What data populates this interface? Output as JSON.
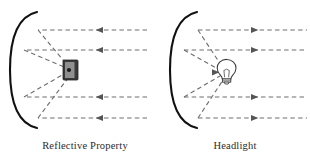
{
  "figure": {
    "background_color": "#ffffff",
    "width": 310,
    "height": 161
  },
  "style": {
    "parabola_color": "#111111",
    "parabola_width": 2.1,
    "ray_color": "#6f6f6f",
    "ray_width": 1.15,
    "ray_dash": "4.5 3.2",
    "arrow_color": "#555555",
    "receiver_body_color": "#3a3a3a",
    "receiver_face_color": "#8a8a8a",
    "receiver_dot_color": "#1a1a1a",
    "bulb_outline_color": "#3a3a3a",
    "bulb_fill_color": "#ffffff",
    "caption_color": "#2b2b2b"
  },
  "panels": [
    {
      "id": "reflective-property",
      "caption": "Reflective Property",
      "ray_direction": "inward",
      "focus_object": "receiver",
      "focus": {
        "x": 70,
        "y": 70
      },
      "parabola": {
        "vertex_x": 10,
        "vertex_y": 70,
        "top_y": 12,
        "bottom_y": 128,
        "opening": "right"
      },
      "horizontal_rays": [
        {
          "y": 30,
          "x_start": 147,
          "x_end": 38
        },
        {
          "y": 50,
          "x_start": 147,
          "x_end": 24
        },
        {
          "y": 97,
          "x_start": 147,
          "x_end": 24
        },
        {
          "y": 118,
          "x_start": 147,
          "x_end": 38
        }
      ],
      "arrow_x": 97,
      "reflected_rays": [
        {
          "from_x": 38,
          "from_y": 30
        },
        {
          "from_x": 24,
          "from_y": 50
        },
        {
          "from_x": 24,
          "from_y": 97
        },
        {
          "from_x": 38,
          "from_y": 118
        }
      ]
    },
    {
      "id": "headlight",
      "caption": "Headlight",
      "ray_direction": "outward",
      "focus_object": "bulb",
      "focus": {
        "x": 225,
        "y": 72
      },
      "parabola": {
        "vertex_x": 170,
        "vertex_y": 70,
        "top_y": 12,
        "bottom_y": 128,
        "opening": "right"
      },
      "horizontal_rays": [
        {
          "y": 30,
          "x_start": 198,
          "x_end": 307
        },
        {
          "y": 50,
          "x_start": 184,
          "x_end": 307
        },
        {
          "y": 97,
          "x_start": 184,
          "x_end": 307
        },
        {
          "y": 118,
          "x_start": 198,
          "x_end": 307
        }
      ],
      "arrow_x": 257,
      "reflected_rays": [
        {
          "from_x": 198,
          "from_y": 30
        },
        {
          "from_x": 184,
          "from_y": 50
        },
        {
          "from_x": 184,
          "from_y": 97
        },
        {
          "from_x": 198,
          "from_y": 118
        }
      ]
    }
  ],
  "receiver": {
    "label": "light receiver",
    "x": 63,
    "y": 60,
    "width": 15,
    "height": 20
  },
  "bulb": {
    "label": "light bulb",
    "x": 225,
    "y": 72
  }
}
